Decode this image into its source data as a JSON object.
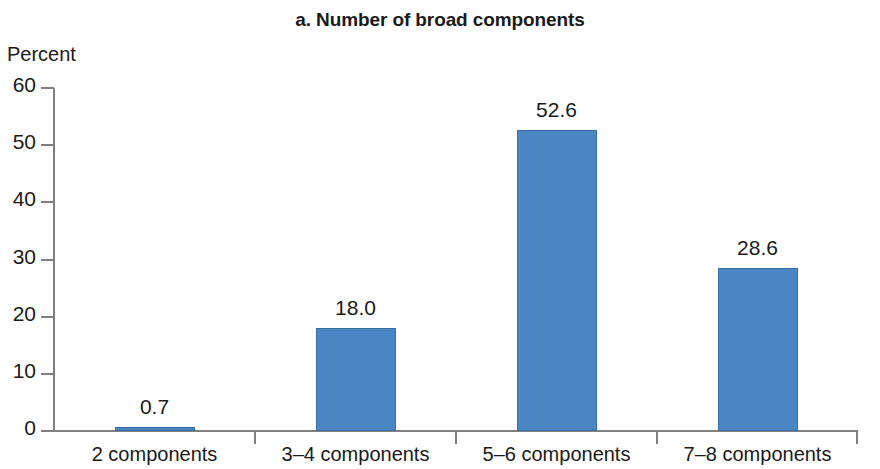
{
  "chart_data": {
    "type": "bar",
    "title": "a. Number of broad components",
    "xlabel": "",
    "ylabel": "Percent",
    "categories": [
      "2 components",
      "3–4 components",
      "5–6 components",
      "7–8 components"
    ],
    "values": [
      0.7,
      18.0,
      52.6,
      28.6
    ],
    "value_labels": [
      "0.7",
      "18.0",
      "52.6",
      "28.6"
    ],
    "ylim": [
      0,
      60
    ],
    "yticks": [
      0,
      10,
      20,
      30,
      40,
      50,
      60
    ],
    "ytick_labels": [
      "0",
      "10",
      "20",
      "30",
      "40",
      "50",
      "60"
    ],
    "grid": false,
    "legend": null,
    "bar_color": "#4a86c3",
    "bar_border_color": "#3a6fa5",
    "axis_color": "#808080",
    "text_color": "#1a1a1a"
  }
}
